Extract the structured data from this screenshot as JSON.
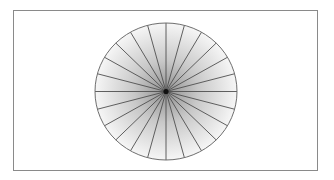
{
  "diagram": {
    "type": "radial-spoke-circle",
    "frame": {
      "border_color": "#8a8a8a",
      "background": "#ffffff"
    },
    "circle": {
      "center_x": 166,
      "center_y": 91.5,
      "radius_x": 71,
      "radius_y": 68.5,
      "stroke_color": "#6e6e6e",
      "fill_gradient": {
        "type": "radial",
        "stops": [
          {
            "offset": "0%",
            "color": "#8f8f8f"
          },
          {
            "offset": "45%",
            "color": "#c8c8c8"
          },
          {
            "offset": "100%",
            "color": "#f6f6f6"
          }
        ]
      }
    },
    "spokes": {
      "count": 24,
      "angle_step_degrees": 15,
      "stroke_color": "#4f4f4f",
      "stroke_width": 0.9
    },
    "hub": {
      "radius": 2.6,
      "color": "#111111"
    }
  }
}
